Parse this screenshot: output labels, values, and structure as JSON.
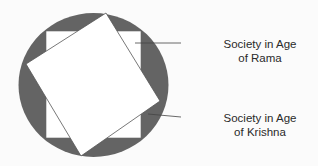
{
  "diagram": {
    "colors": {
      "circle": "#646464",
      "square": "#ffffff",
      "stroke": "#555555",
      "background": "#fbfbfb"
    },
    "labels": [
      {
        "id": "rama",
        "line1": "Society in Age",
        "line2": "of Rama"
      },
      {
        "id": "krishna",
        "line1": "Society in Age",
        "line2": "of Krishna"
      }
    ]
  }
}
